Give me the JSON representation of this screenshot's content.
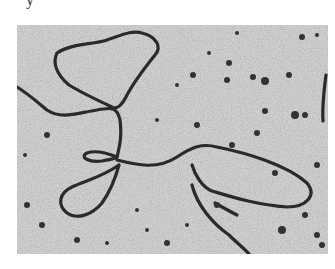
{
  "caption_fragment": "y",
  "micrograph": {
    "description": "Grayscale electron micrograph of branched DNA strands with loops on a speckled background",
    "background_color": "#cfcfcf",
    "strand_color": "#2a2a2a",
    "particle_color": "#333333",
    "strands": [
      {
        "name": "top-left-loop",
        "d": "M40,28 C55,18 75,20 90,15 C105,10 115,5 125,8 C140,12 145,22 138,30 C130,40 118,55 110,70 C105,80 100,85 95,82 C80,75 65,68 52,60 C40,50 35,38 40,28 Z"
      },
      {
        "name": "left-strand",
        "d": "M0,62 C10,68 18,75 30,85 C45,95 60,88 80,85 C95,82 100,82 103,95 C105,110 103,120 100,132"
      },
      {
        "name": "center-upper-loop",
        "d": "M100,132 C90,128 78,125 70,128 C62,132 72,138 85,136 C95,134 100,133 100,132"
      },
      {
        "name": "center-lower-loop",
        "d": "M102,140 C98,155 92,168 85,178 C75,190 60,195 50,188 C40,180 42,168 55,162 C70,155 85,152 102,140"
      },
      {
        "name": "right-loop",
        "d": "M100,135 C120,140 140,145 160,132 C175,122 185,118 200,122 C230,128 270,140 290,158 C300,170 290,182 270,182 C240,180 215,172 195,166 C185,162 178,150 175,140"
      },
      {
        "name": "lower-right-strand",
        "d": "M175,160 C180,180 195,198 212,210 C220,218 228,224 232,229"
      },
      {
        "name": "lower-right-branch",
        "d": "M198,178 C205,182 212,186 220,190"
      },
      {
        "name": "right-edge-strand",
        "d": "M309,50 C307,65 305,80 306,96"
      }
    ],
    "particles": [
      [
        176,
        50,
        3
      ],
      [
        212,
        38,
        3
      ],
      [
        236,
        52,
        3
      ],
      [
        248,
        56,
        4
      ],
      [
        272,
        50,
        3
      ],
      [
        210,
        55,
        3
      ],
      [
        248,
        86,
        3
      ],
      [
        278,
        90,
        4
      ],
      [
        288,
        90,
        3
      ],
      [
        220,
        8,
        2
      ],
      [
        285,
        12,
        3
      ],
      [
        300,
        10,
        2
      ],
      [
        192,
        28,
        2
      ],
      [
        160,
        60,
        2
      ],
      [
        180,
        100,
        3
      ],
      [
        30,
        110,
        3
      ],
      [
        10,
        180,
        3
      ],
      [
        25,
        200,
        3
      ],
      [
        150,
        218,
        3
      ],
      [
        200,
        180,
        3
      ],
      [
        265,
        205,
        4
      ],
      [
        288,
        190,
        3
      ],
      [
        300,
        210,
        3
      ],
      [
        60,
        215,
        3
      ],
      [
        130,
        205,
        2
      ],
      [
        240,
        108,
        3
      ],
      [
        140,
        95,
        2
      ],
      [
        215,
        120,
        3
      ],
      [
        258,
        148,
        3
      ],
      [
        300,
        140,
        3
      ],
      [
        120,
        185,
        2
      ],
      [
        170,
        200,
        2
      ],
      [
        8,
        130,
        2
      ],
      [
        305,
        220,
        3
      ],
      [
        90,
        218,
        2
      ]
    ]
  }
}
